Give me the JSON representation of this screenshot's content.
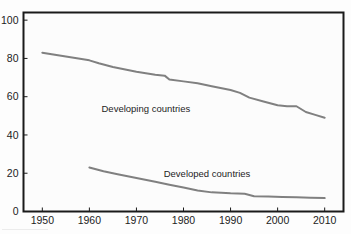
{
  "figure": {
    "background_color": "#fdfdfd",
    "plot_background_color": "#fcfcfc",
    "frame_color": "#1a1a1a",
    "line_color": "#808080",
    "clipped_title": ""
  },
  "chart_data": {
    "type": "line",
    "title": "",
    "subtitle": "",
    "xlabel": "",
    "ylabel": "",
    "xlim": [
      1946,
      2014
    ],
    "ylim": [
      0,
      104
    ],
    "xticks": [
      1950,
      1960,
      1970,
      1980,
      1990,
      2000,
      2010
    ],
    "yticks": [
      0,
      20,
      40,
      60,
      80,
      100
    ],
    "xtick_labels": [
      "1950",
      "1960",
      "1970",
      "1980",
      "1990",
      "2000",
      "2010"
    ],
    "ytick_labels": [
      "0",
      "20",
      "40",
      "60",
      "80",
      "100"
    ],
    "grid": false,
    "legend_position": "inline-annotation",
    "series": [
      {
        "name": "Developing countries",
        "color": "#808080",
        "label_x": 1972,
        "label_y": 52,
        "x": [
          1950,
          1955,
          1960,
          1962,
          1965,
          1970,
          1974,
          1976,
          1977,
          1980,
          1983,
          1986,
          1990,
          1992,
          1994,
          1997,
          2000,
          2002,
          2004,
          2006,
          2008,
          2010
        ],
        "values": [
          83,
          81,
          79,
          77.5,
          75.5,
          73,
          71.5,
          71,
          69,
          68,
          67,
          65.5,
          63.5,
          62,
          59.5,
          57.5,
          55.5,
          55,
          55,
          52,
          50.5,
          49
        ]
      },
      {
        "name": "Developed countries",
        "color": "#808080",
        "label_x": 1985,
        "label_y": 18,
        "x": [
          1960,
          1963,
          1966,
          1970,
          1974,
          1977,
          1980,
          1983,
          1986,
          1990,
          1993,
          1995,
          1998,
          2001,
          2004,
          2007,
          2010
        ],
        "values": [
          23,
          21,
          19.5,
          17.5,
          15.5,
          14,
          12.5,
          11,
          10,
          9.5,
          9.3,
          8,
          7.8,
          7.6,
          7.4,
          7.2,
          7
        ]
      }
    ]
  }
}
